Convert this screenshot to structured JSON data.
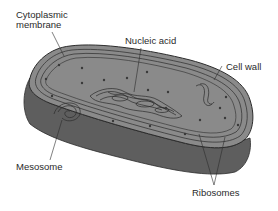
{
  "diagram": {
    "labels": {
      "cytoplasmic_membrane_line1": "Cytoplasmic",
      "cytoplasmic_membrane_line2": "membrane",
      "nucleic_acid": "Nucleic acid",
      "cell_wall": "Cell wall",
      "mesosome": "Mesosome",
      "ribosomes": "Ribosomes"
    },
    "colors": {
      "cell_top": "#8a8a8a",
      "cell_side": "#5e5e5e",
      "outline": "#2b2b2b",
      "dots": "#3a3a3a"
    }
  }
}
